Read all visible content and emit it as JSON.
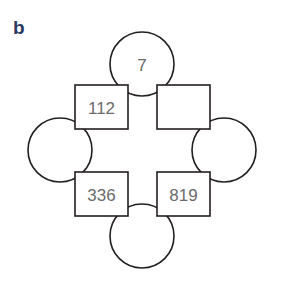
{
  "panel": {
    "label": "b",
    "label_color": "#2b3a63"
  },
  "diagram": {
    "type": "ring-puzzle",
    "shape_stroke_color": "#231f20",
    "shape_fill_color": "#ffffff",
    "value_text_color": "#6b6b6b",
    "nodes": [
      {
        "id": "circle-top",
        "shape": "circle",
        "position": "top",
        "cx": 142,
        "cy": 64,
        "r": 32,
        "value": "7"
      },
      {
        "id": "circle-left",
        "shape": "circle",
        "position": "left",
        "cx": 60,
        "cy": 150,
        "r": 32,
        "value": ""
      },
      {
        "id": "circle-right",
        "shape": "circle",
        "position": "right",
        "cx": 224,
        "cy": 150,
        "r": 32,
        "value": ""
      },
      {
        "id": "circle-bottom",
        "shape": "circle",
        "position": "bottom",
        "cx": 142,
        "cy": 236,
        "r": 32,
        "value": ""
      },
      {
        "id": "square-top-left",
        "shape": "square",
        "position": "top-left",
        "x": 75,
        "y": 85,
        "w": 53,
        "h": 44,
        "value": "112"
      },
      {
        "id": "square-top-right",
        "shape": "square",
        "position": "top-right",
        "x": 157,
        "y": 85,
        "w": 53,
        "h": 44,
        "value": ""
      },
      {
        "id": "square-bottom-left",
        "shape": "square",
        "position": "bottom-left",
        "x": 75,
        "y": 172,
        "w": 53,
        "h": 44,
        "value": "336"
      },
      {
        "id": "square-bottom-right",
        "shape": "square",
        "position": "bottom-right",
        "x": 157,
        "y": 172,
        "w": 53,
        "h": 44,
        "value": "819"
      }
    ]
  }
}
